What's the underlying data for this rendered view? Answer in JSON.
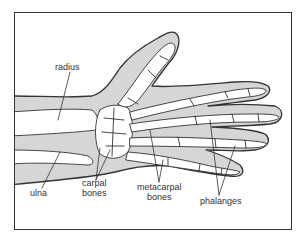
{
  "diagram": {
    "colors": {
      "skin": "#d6d6d6",
      "outline": "#333333",
      "bone": "#ffffff",
      "background": "#ffffff"
    },
    "labels": {
      "radius": "radius",
      "ulna": "ulna",
      "carpal_line1": "carpal",
      "carpal_line2": "bones",
      "metacarpal_line1": "metacarpal",
      "metacarpal_line2": "bones",
      "phalanges": "phalanges"
    }
  }
}
